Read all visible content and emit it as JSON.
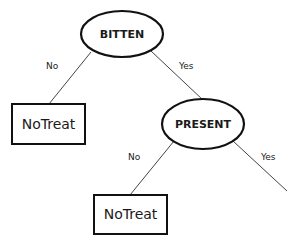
{
  "diagram": {
    "type": "decision-tree",
    "nodes": [
      {
        "id": "bitten",
        "label": "BITTEN",
        "shape": "ellipse"
      },
      {
        "id": "notreat1",
        "label": "NoTreat",
        "shape": "rectangle"
      },
      {
        "id": "present",
        "label": "PRESENT",
        "shape": "ellipse"
      },
      {
        "id": "notreat2",
        "label": "NoTreat",
        "shape": "rectangle"
      }
    ],
    "edges": [
      {
        "from": "bitten",
        "to": "notreat1",
        "label": "No"
      },
      {
        "from": "bitten",
        "to": "present",
        "label": "Yes"
      },
      {
        "from": "present",
        "to": "notreat2",
        "label": "No"
      },
      {
        "from": "present",
        "to": null,
        "label": "Yes"
      }
    ]
  },
  "colors": {
    "stroke": "#111111",
    "edge": "#444444",
    "background": "#ffffff"
  }
}
